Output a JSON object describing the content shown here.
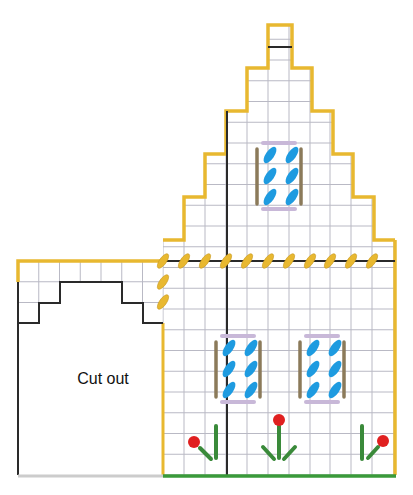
{
  "diagram": {
    "type": "needlepoint-chart",
    "cutout_label": "Cut out",
    "caption": "",
    "colors": {
      "grid": "#b9b9c4",
      "outline_black": "#2a2a2a",
      "gold": "#e8b830",
      "gold_stroke": "#c89a20",
      "window_glass": "#1e9be0",
      "window_frame_side": "#8b7a5a",
      "window_frame_topbottom": "#c8b8d8",
      "stem_green": "#3a8a3a",
      "flower_red": "#e02020",
      "base_green": "#3a9a3a",
      "base_gray": "#cccccc"
    },
    "cell_size": 20.75,
    "main_grid": {
      "x0": 163,
      "x1": 394,
      "y_bottom": 475,
      "columns": [
        163,
        184,
        205,
        226,
        247,
        268,
        289,
        310,
        330,
        351,
        372,
        394
      ]
    },
    "gable_outline": [
      [
        163,
        475
      ],
      [
        163,
        240
      ],
      [
        184,
        240
      ],
      [
        184,
        197
      ],
      [
        205,
        197
      ],
      [
        205,
        154
      ],
      [
        226,
        154
      ],
      [
        226,
        111
      ],
      [
        247,
        111
      ],
      [
        247,
        68
      ],
      [
        268,
        68
      ],
      [
        268,
        25
      ],
      [
        292,
        25
      ],
      [
        292,
        68
      ],
      [
        312,
        68
      ],
      [
        312,
        111
      ],
      [
        333,
        111
      ],
      [
        333,
        154
      ],
      [
        353,
        154
      ],
      [
        353,
        197
      ],
      [
        374,
        197
      ],
      [
        374,
        240
      ],
      [
        395,
        240
      ],
      [
        395,
        475
      ]
    ],
    "wing": {
      "x0": 18,
      "x1": 163,
      "y_top": 261,
      "y_bottom": 475,
      "cutout_outline": [
        [
          18,
          323
        ],
        [
          39,
          323
        ],
        [
          39,
          303
        ],
        [
          60,
          303
        ],
        [
          60,
          282
        ],
        [
          122,
          282
        ],
        [
          122,
          303
        ],
        [
          143,
          303
        ],
        [
          143,
          323
        ],
        [
          163,
          323
        ]
      ]
    },
    "chimney_divider": {
      "x1": 268,
      "x2": 292,
      "y": 47
    },
    "black_lines": {
      "horizontal": {
        "x1": 163,
        "x2": 395,
        "y": 261
      },
      "vertical": {
        "x": 227,
        "y1": 111,
        "y2": 475
      }
    },
    "gold_stitches": [
      [
        163,
        261
      ],
      [
        184,
        261
      ],
      [
        205,
        261
      ],
      [
        226,
        261
      ],
      [
        247,
        261
      ],
      [
        268,
        261
      ],
      [
        289,
        261
      ],
      [
        310,
        261
      ],
      [
        330,
        261
      ],
      [
        351,
        261
      ],
      [
        372,
        261
      ],
      [
        163,
        282
      ],
      [
        163,
        302
      ]
    ],
    "windows": [
      {
        "name": "upper-window",
        "x": 257,
        "y": 143,
        "w": 44,
        "h": 66
      },
      {
        "name": "lower-left-window",
        "x": 216,
        "y": 336,
        "w": 44,
        "h": 66
      },
      {
        "name": "lower-right-window",
        "x": 300,
        "y": 336,
        "w": 44,
        "h": 66
      }
    ],
    "flowers": [
      {
        "name": "left-flower",
        "head": [
          194,
          442
        ],
        "stems": [
          [
            [
              200,
              448
            ],
            [
              211,
              459
            ]
          ],
          [
            [
              216,
              426
            ],
            [
              216,
              458
            ]
          ]
        ]
      },
      {
        "name": "middle-flower",
        "head": [
          279,
          420
        ],
        "stems": [
          [
            [
              279,
              426
            ],
            [
              279,
              458
            ]
          ],
          [
            [
              263,
              447
            ],
            [
              274,
              459
            ]
          ],
          [
            [
              295,
              447
            ],
            [
              284,
              459
            ]
          ]
        ]
      },
      {
        "name": "right-flower",
        "head": [
          383,
          441
        ],
        "stems": [
          [
            [
              378,
              447
            ],
            [
              368,
              458
            ]
          ],
          [
            [
              362,
              426
            ],
            [
              362,
              459
            ]
          ]
        ]
      }
    ]
  }
}
